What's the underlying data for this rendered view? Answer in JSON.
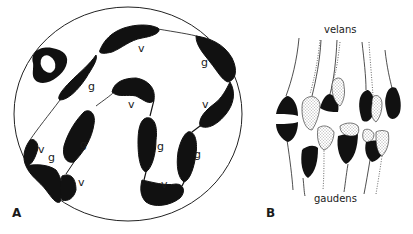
{
  "figure": {
    "panel_a": {
      "label": "A",
      "segment_labels": [
        {
          "text": "v",
          "x": 141,
          "y": 50
        },
        {
          "text": "g",
          "x": 204,
          "y": 64
        },
        {
          "text": "g",
          "x": 89,
          "y": 88
        },
        {
          "text": "v",
          "x": 131,
          "y": 107
        },
        {
          "text": "v",
          "x": 204,
          "y": 107
        },
        {
          "text": "v",
          "x": 40,
          "y": 152
        },
        {
          "text": "g",
          "x": 50,
          "y": 159
        },
        {
          "text": "g",
          "x": 81,
          "y": 146
        },
        {
          "text": "g",
          "x": 158,
          "y": 148
        },
        {
          "text": "g",
          "x": 196,
          "y": 157
        },
        {
          "text": "v",
          "x": 79,
          "y": 184
        },
        {
          "text": "v",
          "x": 162,
          "y": 186
        }
      ]
    },
    "panel_b": {
      "label": "B",
      "top_label": "velans",
      "bottom_label": "gaudens"
    },
    "colors": {
      "ink": "#111111",
      "background": "#ffffff"
    }
  }
}
